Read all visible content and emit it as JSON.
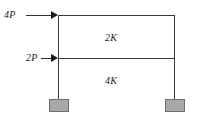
{
  "figure": {
    "type": "two-bay-portal-frame-diagram",
    "background_color": "#ffffff",
    "line_color": "#3a3a3a",
    "support_fill_color": "#a8a8a8",
    "support_border_color": "#6e6e6e"
  },
  "loads": [
    {
      "id": "top-load",
      "label": "4P",
      "direction": "right",
      "applied_at": "top-left-joint"
    },
    {
      "id": "mid-load",
      "label": "2P",
      "direction": "right",
      "applied_at": "mid-left-joint"
    }
  ],
  "stiffness_labels": [
    {
      "id": "upper-story",
      "label": "2K",
      "location": "upper-bay"
    },
    {
      "id": "lower-story",
      "label": "4K",
      "location": "lower-bay"
    }
  ],
  "supports": [
    {
      "id": "left-support",
      "type": "fixed"
    },
    {
      "id": "right-support",
      "type": "fixed"
    }
  ]
}
